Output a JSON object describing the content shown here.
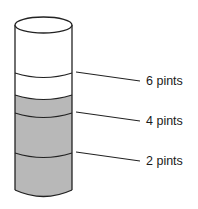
{
  "diagram": {
    "type": "graduated-cylinder",
    "fill_color": "#b8b8b8",
    "labels": [
      {
        "text": "6 pints",
        "y": 81
      },
      {
        "text": "4 pints",
        "y": 121
      },
      {
        "text": "2 pints",
        "y": 161
      }
    ]
  }
}
